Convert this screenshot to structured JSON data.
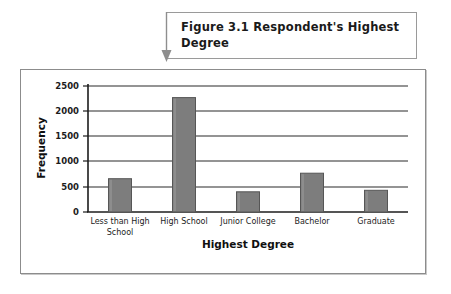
{
  "caption": {
    "label": "Figure 3.1",
    "text": "Figure 3.1  Respondent's Highest Degree",
    "pointer_icon": "down-arrow-pointer-icon"
  },
  "colors": {
    "bar_fill": "#7d7d7d",
    "bar_outline": "#565656",
    "bar_highlight": "#9a9a9a",
    "axis": "#1c1c1c",
    "gridline": "#2b2b2b",
    "frame_border": "#8c8c8c",
    "caption_border": "#9a9a9a",
    "pointer": "#8e8e8e",
    "background": "#ffffff"
  },
  "chart_data": {
    "type": "bar",
    "title": "Respondent's Highest Degree",
    "xlabel": "Highest Degree",
    "ylabel": "Frequency",
    "categories": [
      "Less than High School",
      "High School",
      "Junior College",
      "Bachelor",
      "Graduate"
    ],
    "values": [
      660,
      2270,
      400,
      770,
      430
    ],
    "ylim": [
      0,
      2500
    ],
    "yticks": [
      0,
      500,
      1000,
      1500,
      2000,
      2500
    ],
    "ytick_labels": [
      "0",
      "500",
      "1000",
      "1500",
      "2000",
      "2500"
    ],
    "grid": true,
    "grid_axis": "y",
    "legend": false,
    "series": [
      {
        "name": "Frequency",
        "values": [
          660,
          2270,
          400,
          770,
          430
        ]
      }
    ]
  }
}
